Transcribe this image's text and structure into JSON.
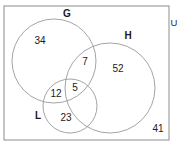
{
  "diagram": {
    "type": "venn",
    "title": "",
    "universe": {
      "label": "U",
      "outside_count": "41"
    },
    "sets": [
      {
        "key": "G",
        "label": "G",
        "label_x": 67,
        "label_y": 17,
        "cx": 54,
        "cy": 61,
        "r": 42
      },
      {
        "key": "H",
        "label": "H",
        "label_x": 128,
        "label_y": 39,
        "cx": 110,
        "cy": 88,
        "r": 45
      },
      {
        "key": "L",
        "label": "L",
        "label_x": 38,
        "label_y": 119,
        "cx": 70,
        "cy": 106,
        "r": 27
      }
    ],
    "regions": [
      {
        "name": "G-only",
        "value": "34",
        "x": 40,
        "y": 44
      },
      {
        "name": "G-and-H-only",
        "value": "7",
        "x": 85,
        "y": 65
      },
      {
        "name": "H-only",
        "value": "52",
        "x": 118,
        "y": 72
      },
      {
        "name": "G-and-L-only",
        "value": "12",
        "x": 56,
        "y": 97
      },
      {
        "name": "G-and-H-and-L",
        "value": "5",
        "x": 75,
        "y": 91
      },
      {
        "name": "L-and-H-only",
        "value": "23",
        "x": 66,
        "y": 121
      },
      {
        "name": "outside-all-sets",
        "value": "41",
        "x": 158,
        "y": 132
      }
    ],
    "frame": {
      "x": 4,
      "y": 6,
      "width": 165,
      "height": 134
    },
    "universe_label_pos": {
      "x": 174,
      "y": 26
    },
    "colors": {
      "circle_stroke": "#9a9a9a",
      "frame_stroke": "#8c8c8c",
      "text": "#1a1a1a",
      "background": "#ffffff"
    }
  }
}
